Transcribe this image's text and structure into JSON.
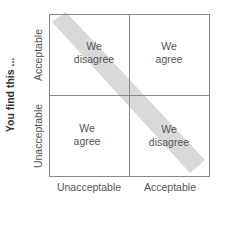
{
  "y_axis": {
    "title": "You find this ...",
    "ticks": [
      "Acceptable",
      "Unacceptable"
    ]
  },
  "x_axis": {
    "ticks": [
      "Unacceptable",
      "Acceptable"
    ]
  },
  "cells": {
    "top_left": {
      "line1": "We",
      "line2": "disagree"
    },
    "top_right": {
      "line1": "We",
      "line2": "agree"
    },
    "bottom_left": {
      "line1": "We",
      "line2": "agree"
    },
    "bottom_right": {
      "line1": "We",
      "line2": "disagree"
    }
  },
  "colors": {
    "band": "#d9d9d9",
    "grid": "#888888"
  }
}
